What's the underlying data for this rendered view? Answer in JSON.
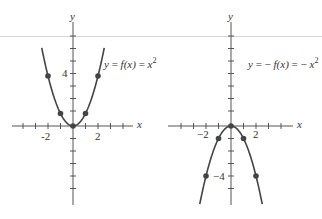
{
  "figure": {
    "graphs": [
      {
        "id": "left",
        "equation": "y = f(x) = x²",
        "equation_parts": {
          "lhs": "y",
          "eq1": " = ",
          "fx": "f(x)",
          "eq2": " = ",
          "rhs_var": "x",
          "rhs_exp": "2"
        },
        "axis_labels": {
          "x": "x",
          "y": "y"
        },
        "tick_labels": {
          "x_neg": "-2",
          "x_pos": "2",
          "y": "4"
        },
        "curve": "x^2",
        "points": [
          [
            -2,
            4
          ],
          [
            -1,
            1
          ],
          [
            0,
            0
          ],
          [
            1,
            1
          ],
          [
            2,
            4
          ]
        ]
      },
      {
        "id": "right",
        "equation": "y = − f(x) = − x²",
        "equation_parts": {
          "lhs": "y",
          "eq1": " = − ",
          "fx": "f(x)",
          "eq2": " = − ",
          "rhs_var": "x",
          "rhs_exp": "2"
        },
        "axis_labels": {
          "x": "x",
          "y": "y"
        },
        "tick_labels": {
          "x_neg": "−2",
          "x_pos": "2",
          "y": "−4"
        },
        "curve": "-x^2",
        "points": [
          [
            -2,
            -4
          ],
          [
            -1,
            -1
          ],
          [
            0,
            0
          ],
          [
            1,
            -1
          ],
          [
            2,
            -4
          ]
        ]
      }
    ],
    "colors": {
      "axis": "#555555",
      "curve": "#444444",
      "point": "#444444",
      "rule": "#d6d6d6"
    }
  }
}
